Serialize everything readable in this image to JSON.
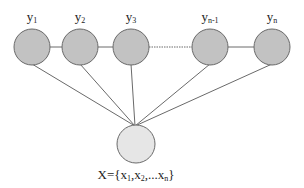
{
  "diagram": {
    "type": "graphical-model",
    "colors": {
      "output_node_fill": "#c2c2c2",
      "input_node_fill": "#e6e6e6",
      "node_stroke": "#6a6a6a",
      "edge": "#6a6a6a",
      "text": "#222222"
    },
    "output_nodes": [
      {
        "id": "y1",
        "base": "y",
        "sub": "1",
        "cx": 32,
        "cy": 47,
        "r": 18
      },
      {
        "id": "y2",
        "base": "y",
        "sub": "2",
        "cx": 80,
        "cy": 47,
        "r": 18
      },
      {
        "id": "y3",
        "base": "y",
        "sub": "3",
        "cx": 131,
        "cy": 47,
        "r": 18
      },
      {
        "id": "yn-1",
        "base": "y",
        "sub": "n-1",
        "cx": 210,
        "cy": 47,
        "r": 18
      },
      {
        "id": "yn",
        "base": "y",
        "sub": "n",
        "cx": 272,
        "cy": 47,
        "r": 18
      }
    ],
    "chain_edges": [
      {
        "from": "y1",
        "to": "y2",
        "style": "solid"
      },
      {
        "from": "y2",
        "to": "y3",
        "style": "solid"
      },
      {
        "from": "y3",
        "to": "yn-1",
        "style": "dotted"
      },
      {
        "from": "yn-1",
        "to": "yn",
        "style": "solid"
      }
    ],
    "input_node": {
      "id": "X",
      "cx": 136,
      "cy": 144,
      "r": 19,
      "label": {
        "prefix": "X={",
        "items": [
          {
            "base": "x",
            "sub": "1"
          },
          {
            "base": "x",
            "sub": "2"
          },
          {
            "base": "x",
            "sub": "n"
          }
        ],
        "separator_1": ",",
        "separator_2": ",...",
        "suffix": "}"
      }
    },
    "convergence_point": {
      "x": 135,
      "y": 126
    }
  }
}
